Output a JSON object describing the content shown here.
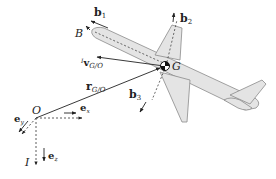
{
  "figure": {
    "type": "rigid-body kinematics diagram"
  },
  "labels": {
    "body_frame": "B",
    "inertial_frame": "I",
    "origin": "O",
    "center_of_mass": "G",
    "b1": "b",
    "b1_sub": "1",
    "b2": "b",
    "b2_sub": "2",
    "b3": "b",
    "b3_sub": "3",
    "ex": "e",
    "ex_sub": "x",
    "ey": "e",
    "ey_sub": "y",
    "ez": "e",
    "ez_sub": "z",
    "r": "r",
    "r_sub": "G/O",
    "v_sup": "I",
    "v": "v",
    "v_sub": "G/O"
  },
  "colors": {
    "line": "#222222",
    "plane_fill": "#e4e4e4",
    "plane_stroke": "#8a8a8a",
    "background": "#ffffff"
  }
}
